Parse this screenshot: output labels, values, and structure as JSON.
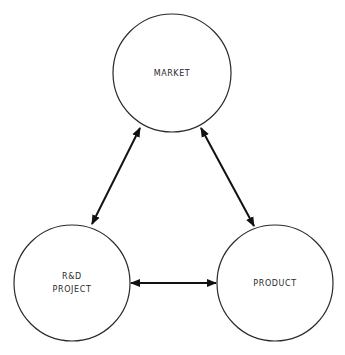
{
  "diagram": {
    "nodes": [
      {
        "id": "market",
        "label_lines": [
          "MARKET"
        ],
        "cx": 172,
        "cy": 73,
        "r": 59
      },
      {
        "id": "rd_project",
        "label_lines": [
          "R&D",
          "PROJECT"
        ],
        "cx": 72,
        "cy": 283,
        "r": 58
      },
      {
        "id": "product",
        "label_lines": [
          "PRODUCT"
        ],
        "cx": 275,
        "cy": 283,
        "r": 58
      }
    ],
    "edges": [
      {
        "from": "market",
        "to": "rd_project",
        "type": "bidirectional"
      },
      {
        "from": "market",
        "to": "product",
        "type": "bidirectional"
      },
      {
        "from": "rd_project",
        "to": "product",
        "type": "bidirectional"
      }
    ],
    "colors": {
      "stroke": "#2a2a2a",
      "arrow": "#111111",
      "background": "#ffffff"
    }
  }
}
